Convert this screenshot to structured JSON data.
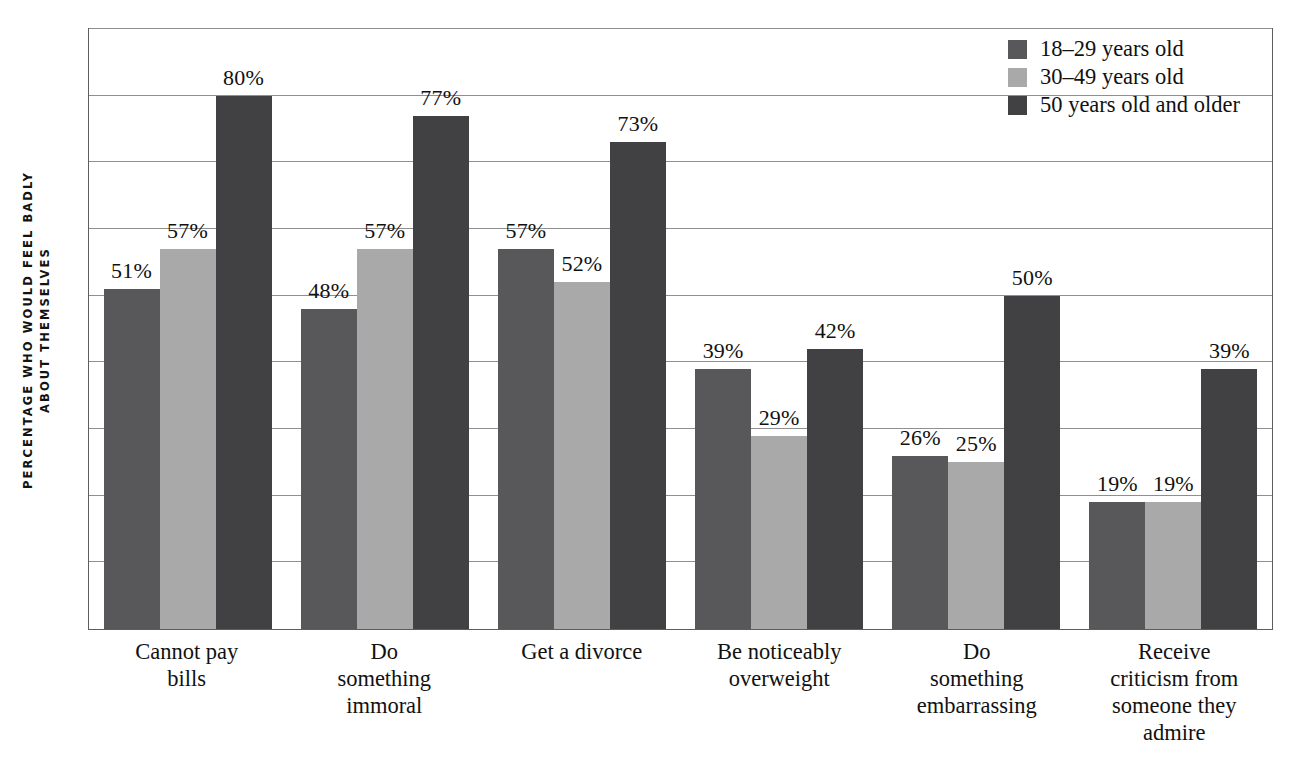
{
  "chart_data": {
    "type": "bar",
    "title": "",
    "xlabel": "",
    "ylabel": "PERCENTAGE WHO WOULD FEEL BADLY ABOUT THEMSELVES",
    "ylabel_lines": [
      "PERCENTAGE WHO WOULD FEEL BADLY",
      "ABOUT THEMSELVES"
    ],
    "ylim": [
      0,
      90
    ],
    "grid": true,
    "grid_interval": 10,
    "gridline_values": [
      10,
      20,
      30,
      40,
      50,
      60,
      70,
      80,
      90
    ],
    "tick_labels": [],
    "legend_position": "top-right",
    "value_label_suffix": "%",
    "categories": [
      "Cannot pay bills",
      "Do something immoral",
      "Get a divorce",
      "Be noticeably overweight",
      "Do something embarrassing",
      "Receive criticism from someone they admire"
    ],
    "category_lines": [
      [
        "Cannot pay",
        "bills"
      ],
      [
        "Do",
        "something",
        "immoral"
      ],
      [
        "Get a divorce"
      ],
      [
        "Be noticeably",
        "overweight"
      ],
      [
        "Do",
        "something",
        "embarrassing"
      ],
      [
        "Receive",
        "criticism from",
        "someone they",
        "admire"
      ]
    ],
    "series": [
      {
        "name": "18–29 years old",
        "color": "#58585a",
        "values": [
          51,
          48,
          57,
          39,
          26,
          19
        ],
        "labels": [
          "51%",
          "48%",
          "57%",
          "39%",
          "26%",
          "19%"
        ]
      },
      {
        "name": "30–49 years old",
        "color": "#a9a9a9",
        "values": [
          57,
          57,
          52,
          29,
          25,
          19
        ],
        "labels": [
          "57%",
          "57%",
          "52%",
          "29%",
          "25%",
          "19%"
        ]
      },
      {
        "name": "50 years old and older",
        "color": "#414143",
        "values": [
          80,
          77,
          73,
          42,
          50,
          39
        ],
        "labels": [
          "80%",
          "77%",
          "73%",
          "42%",
          "50%",
          "39%"
        ]
      }
    ]
  },
  "legend": {
    "items": [
      {
        "label": "18–29 years old",
        "color": "#58585a"
      },
      {
        "label": "30–49 years old",
        "color": "#a9a9a9"
      },
      {
        "label": "50 years old and older",
        "color": "#414143"
      }
    ]
  }
}
